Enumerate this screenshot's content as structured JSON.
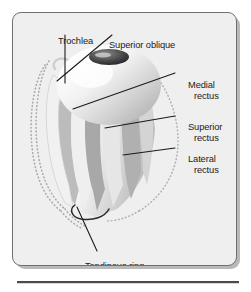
{
  "figure": {
    "frame": {
      "background_color": "#efefef",
      "border_color": "#6f6f6f",
      "shadow_color": "#b9b9b9",
      "page_background": "#ffffff"
    },
    "rule": {
      "color": "#4a4a4a",
      "highlight_color": "#d8d8d8"
    },
    "labels": [
      {
        "id": "trochlea",
        "line1": "Trochlea",
        "line2": "",
        "position": "top-left",
        "leader": "vertical-down"
      },
      {
        "id": "superior-oblique",
        "line1": "Superior oblique",
        "line2": "",
        "position": "top-center",
        "leader": "diagonal-down-left"
      },
      {
        "id": "medial-rectus",
        "line1": "Medial",
        "line2": "rectus",
        "position": "right-upper",
        "leader": "diagonal-down-left"
      },
      {
        "id": "superior-rectus",
        "line1": "Superior",
        "line2": "rectus",
        "position": "right-middle",
        "leader": "horizontal-left"
      },
      {
        "id": "lateral-rectus",
        "line1": "Lateral",
        "line2": "rectus",
        "position": "right-lower",
        "leader": "horizontal-left"
      },
      {
        "id": "tendinous-ring",
        "line1": "Tendinous ring",
        "line2": "",
        "position": "bottom-center",
        "leader": "diagonal-up-right"
      }
    ],
    "anatomy": {
      "eyeball": "globe-of-eye",
      "cornea": "dark-ellipse-pupil",
      "muscle_cone": "conical-bundle-of-rectus-muscles",
      "apex": "tendinous-ring-annulus-of-zinn",
      "orbit_outline": "dotted-bone-orbit-contour"
    }
  }
}
